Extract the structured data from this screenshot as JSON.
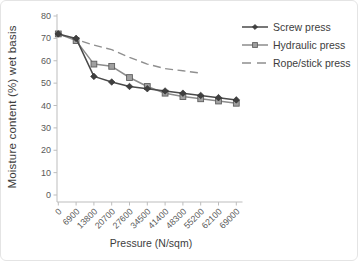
{
  "chart_data": {
    "type": "line",
    "title": "",
    "xlabel": "Pressure (N/sqm)",
    "ylabel": "Moisture content (%) wet basis",
    "x": [
      0,
      6900,
      13800,
      20700,
      27600,
      34500,
      41400,
      48300,
      55200,
      62100,
      69000
    ],
    "x_labels": [
      "0",
      "6900",
      "13800",
      "20700",
      "27600",
      "34500",
      "41400",
      "48300",
      "55200",
      "62100",
      "69000"
    ],
    "yticks": [
      0,
      10,
      20,
      30,
      40,
      50,
      60,
      70,
      80
    ],
    "ylim": [
      0,
      80
    ],
    "grid": false,
    "legend_position": "top-right",
    "axis_color": "#bdbdbd",
    "tick_label_color": "#595959",
    "text_color": "#3d3d3d",
    "series": [
      {
        "name": "Screw press",
        "marker": "diamond",
        "line": "solid",
        "color": "#4a4a4a",
        "marker_fill": "#3f3f3f",
        "marker_edge": "#2e2e2e",
        "values": [
          72,
          70,
          53,
          50.5,
          48.5,
          47.5,
          46.5,
          45.5,
          44.5,
          43.5,
          42.5
        ]
      },
      {
        "name": "Hydraulic press",
        "marker": "square",
        "line": "solid",
        "color": "#8c8c8c",
        "marker_fill": "#a0a0a0",
        "marker_edge": "#5e5e5e",
        "values": [
          72,
          69,
          58.5,
          57.5,
          52.5,
          48.5,
          45.5,
          44,
          43,
          42,
          41
        ]
      },
      {
        "name": "Rope/stick press",
        "marker": "none",
        "line": "dashed",
        "color": "#8f8f8f",
        "marker_fill": "",
        "marker_edge": "",
        "values": [
          72,
          69.5,
          67,
          65,
          61.5,
          58.5,
          56.5,
          55.5,
          54.5,
          null,
          null
        ]
      }
    ]
  }
}
